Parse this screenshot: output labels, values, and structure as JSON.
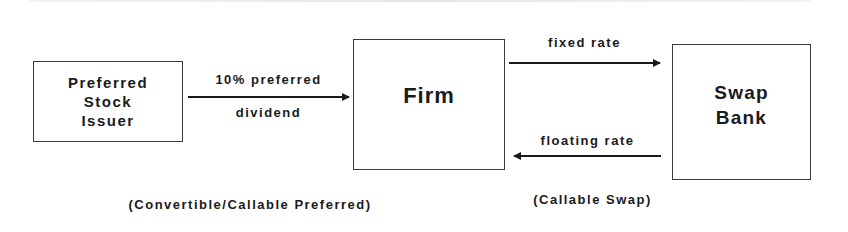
{
  "diagram": {
    "type": "flow",
    "nodes": [
      {
        "id": "issuer",
        "lines": [
          "Preferred",
          "Stock",
          "Issuer"
        ]
      },
      {
        "id": "firm",
        "lines": [
          "Firm"
        ]
      },
      {
        "id": "bank",
        "lines": [
          "Swap",
          "Bank"
        ]
      }
    ],
    "edges": [
      {
        "id": "dividend",
        "from": "issuer",
        "to": "firm",
        "label_top": "10% preferred",
        "label_bottom": "dividend"
      },
      {
        "id": "fixed",
        "from": "firm",
        "to": "bank",
        "label": "fixed rate"
      },
      {
        "id": "floating",
        "from": "bank",
        "to": "firm",
        "label": "floating rate"
      }
    ],
    "captions": {
      "preferred": "(Convertible/Callable Preferred)",
      "swap": "(Callable Swap)"
    }
  }
}
